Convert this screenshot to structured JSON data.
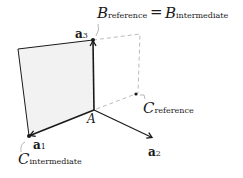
{
  "diagram": {
    "type": "vector-frame",
    "colors": {
      "stroke": "#1a1a1a",
      "fill": "#f2f2f2",
      "dashed": "#bbbbbb"
    },
    "points": {
      "A": [
        94,
        110
      ],
      "a1_tip": [
        29,
        136
      ],
      "a2_tip": [
        153,
        138
      ],
      "a3_tip": [
        93,
        40
      ],
      "corner": [
        18,
        49
      ],
      "dash_right_top": [
        140,
        34
      ],
      "C_reference": [
        136,
        94
      ]
    },
    "labels": {
      "origin": "A",
      "a1": {
        "base": "a",
        "sub": "1"
      },
      "a2": {
        "base": "a",
        "sub": "2"
      },
      "a3": {
        "base": "a",
        "sub": "3"
      },
      "b_ref": {
        "base": "B",
        "sub": "reference"
      },
      "equals": "=",
      "b_int": {
        "base": "B",
        "sub": "intermediate"
      },
      "c_ref": {
        "base": "C",
        "sub": "reference"
      },
      "c_int": {
        "base": "C",
        "sub": "intermediate"
      }
    }
  }
}
